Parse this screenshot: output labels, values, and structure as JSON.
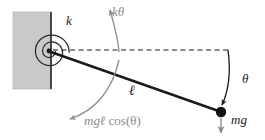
{
  "figure": {
    "labels": {
      "spring_constant": "k",
      "spring_torque": "kθ",
      "angle": "θ",
      "weight_force": "mg",
      "rod_length": "ℓ",
      "gravity_torque_prefix": "mgℓ ",
      "gravity_torque_func": "cos(θ)"
    },
    "colors": {
      "wall_fill": "#c9c9c9",
      "wall_edge": "#1a1a1a",
      "rod": "#1a1a1a",
      "bob": "#111111",
      "dashed_line": "#1a1a1a",
      "arrow_gray": "#8c8c8c",
      "arrow_black": "#1a1a1a",
      "background": "#ffffff"
    },
    "geometry": {
      "pivot": {
        "x": 49,
        "y": 51
      },
      "bob": {
        "x": 221,
        "y": 112,
        "r": 5
      },
      "wall": {
        "x": 13,
        "y": 12,
        "width": 38,
        "height": 77
      },
      "dashed_line": {
        "x1": 53,
        "y1": 50,
        "x2": 228,
        "y2": 50
      },
      "spiral_turns": 2.6,
      "spiral_outer_radius": 14
    },
    "elements": [
      "wall-hatch-block",
      "wall-edge-line",
      "torsional-spring-spiral",
      "pivot-point",
      "pendulum-rod",
      "pendulum-bob",
      "horizontal-dashed-reference",
      "spring-torque-arrow",
      "gravity-torque-arrow",
      "angle-arc-arrow",
      "weight-arrow"
    ]
  }
}
